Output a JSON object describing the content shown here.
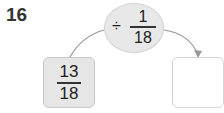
{
  "problem_number": "16",
  "operation": {
    "operator": "÷",
    "numerator": "1",
    "denominator": "18"
  },
  "input_box": {
    "numerator": "13",
    "denominator": "18"
  },
  "output_box": {
    "value": ""
  },
  "colors": {
    "shaded": "#e6e6e6",
    "border": "#c8c8c8",
    "arrow": "#999999"
  }
}
